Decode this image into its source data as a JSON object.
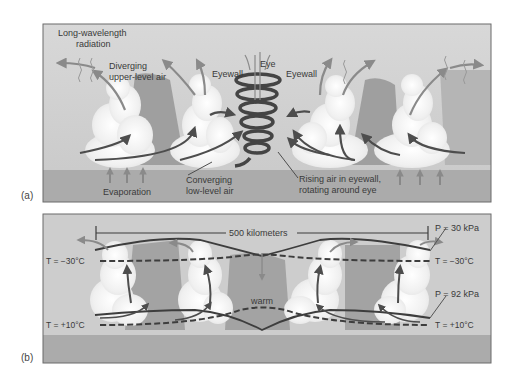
{
  "figure": {
    "panels": [
      {
        "id": "a",
        "label": "(a)",
        "labels": {
          "radiation_line1": "Long-wavelength",
          "radiation_line2": "radiation",
          "diverging_line1": "Diverging",
          "diverging_line2": "upper-level air",
          "eyewall_left": "Eyewall",
          "eye": "Eye",
          "eyewall_right": "Eyewall",
          "evaporation": "Evaporation",
          "converging_line1": "Converging",
          "converging_line2": "low-level air",
          "rising_line1": "Rising air in eyewall,",
          "rising_line2": "rotating around eye"
        }
      },
      {
        "id": "b",
        "label": "(b)",
        "labels": {
          "scale": "500 kilometers",
          "p_top": "P = 30 kPa",
          "t_top_left": "T = −30°C",
          "t_top_right": "T = −30°C",
          "p_bottom": "P = 92 kPa",
          "t_bottom_left": "T = +10°C",
          "t_bottom_right": "T = +10°C",
          "warm": "warm"
        }
      }
    ],
    "colors": {
      "sky": "#cfcfcf",
      "sky_dark": "#9e9e9e",
      "ocean": "#a9a9a9",
      "cloud": "#f6f6f6",
      "arrow": "#4d4d4d",
      "arrow_light": "#8a8a8a",
      "border": "#6b6b6b",
      "text": "#3a3a3a"
    }
  }
}
